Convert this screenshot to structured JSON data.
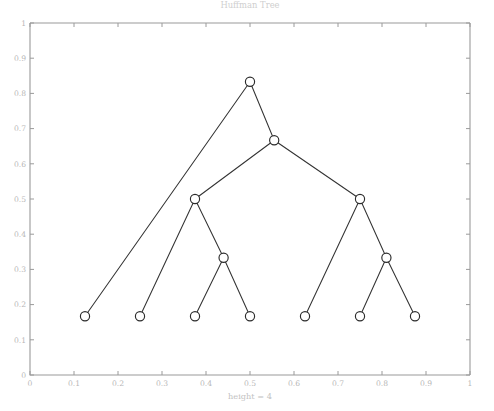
{
  "figure": {
    "title": "Huffman Tree",
    "width": 494,
    "height": 411,
    "background": "#ffffff"
  },
  "axes": {
    "xlabel": "height = 4",
    "ylabel": "",
    "x_ticks": [
      "0",
      "0.1",
      "0.2",
      "0.3",
      "0.4",
      "0.5",
      "0.6",
      "0.7",
      "0.8",
      "0.9",
      "1"
    ],
    "y_ticks": [
      "0",
      "0.1",
      "0.2",
      "0.3",
      "0.4",
      "0.5",
      "0.6",
      "0.7",
      "0.8",
      "0.9",
      "1"
    ],
    "tick_color": "#b8b8b8",
    "axis_color": "#9a9a9a",
    "xlim": [
      0,
      1
    ],
    "ylim": [
      0,
      1
    ],
    "grid": false
  },
  "chart_data": {
    "type": "scatter",
    "title": "Huffman Tree",
    "xlabel": "height = 4",
    "ylabel": "",
    "xlim": [
      0,
      1
    ],
    "ylim": [
      0,
      1
    ],
    "grid": false,
    "legend": null,
    "node_marker": "open-circle",
    "node_color": "#2b2b2b",
    "edge_color": "#333333",
    "nodes": [
      {
        "id": "root",
        "x": 0.5,
        "y": 0.833,
        "kind": "internal",
        "depth": 0
      },
      {
        "id": "n1",
        "x": 0.555,
        "y": 0.667,
        "kind": "internal",
        "depth": 1
      },
      {
        "id": "n2",
        "x": 0.375,
        "y": 0.5,
        "kind": "internal",
        "depth": 2
      },
      {
        "id": "n3",
        "x": 0.75,
        "y": 0.5,
        "kind": "internal",
        "depth": 2
      },
      {
        "id": "n4",
        "x": 0.44,
        "y": 0.333,
        "kind": "internal",
        "depth": 3
      },
      {
        "id": "n5",
        "x": 0.81,
        "y": 0.333,
        "kind": "internal",
        "depth": 3
      },
      {
        "id": "leaf1",
        "x": 0.125,
        "y": 0.167,
        "kind": "leaf",
        "depth": 2
      },
      {
        "id": "leaf2",
        "x": 0.25,
        "y": 0.167,
        "kind": "leaf",
        "depth": 3
      },
      {
        "id": "leaf3",
        "x": 0.375,
        "y": 0.167,
        "kind": "leaf",
        "depth": 4
      },
      {
        "id": "leaf4",
        "x": 0.5,
        "y": 0.167,
        "kind": "leaf",
        "depth": 4
      },
      {
        "id": "leaf5",
        "x": 0.625,
        "y": 0.167,
        "kind": "leaf",
        "depth": 3
      },
      {
        "id": "leaf6",
        "x": 0.75,
        "y": 0.167,
        "kind": "leaf",
        "depth": 4
      },
      {
        "id": "leaf7",
        "x": 0.875,
        "y": 0.167,
        "kind": "leaf",
        "depth": 4
      }
    ],
    "edges": [
      {
        "from": "root",
        "to": "leaf1"
      },
      {
        "from": "root",
        "to": "n1"
      },
      {
        "from": "n1",
        "to": "n2"
      },
      {
        "from": "n1",
        "to": "n3"
      },
      {
        "from": "n2",
        "to": "leaf2"
      },
      {
        "from": "n2",
        "to": "n4"
      },
      {
        "from": "n4",
        "to": "leaf3"
      },
      {
        "from": "n4",
        "to": "leaf4"
      },
      {
        "from": "n3",
        "to": "leaf5"
      },
      {
        "from": "n3",
        "to": "n5"
      },
      {
        "from": "n5",
        "to": "leaf6"
      },
      {
        "from": "n5",
        "to": "leaf7"
      }
    ]
  }
}
